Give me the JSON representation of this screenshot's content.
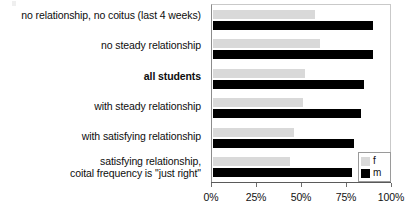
{
  "chart_data": {
    "type": "bar",
    "orientation": "horizontal",
    "title": "",
    "subtitle": "",
    "xlabel": "",
    "ylabel": "",
    "xlim": [
      0,
      100
    ],
    "grid": false,
    "legend_position": "bottom-right",
    "xticks": [
      "0%",
      "25%",
      "50%",
      "75%",
      "100%"
    ],
    "xtick_values": [
      0,
      25,
      50,
      75,
      100
    ],
    "categories": [
      "no relationship, no coitus (last 4 weeks)",
      "no steady relationship",
      "all students",
      "with steady relationship",
      "with satisfying relationship",
      "satisfying relationship, coital frequency is \"just right\""
    ],
    "category_lines": [
      [
        "no relationship, no coitus (last 4 weeks)"
      ],
      [
        "no steady relationship"
      ],
      [
        "all students"
      ],
      [
        "with steady relationship"
      ],
      [
        "with satisfying relationship"
      ],
      [
        "satisfying relationship,",
        "coital frequency is \"just right\""
      ]
    ],
    "emphasized_category_index": 2,
    "series": [
      {
        "name": "f",
        "color": "#d9d9d9",
        "values": [
          58,
          61,
          52,
          51,
          46,
          44
        ]
      },
      {
        "name": "m",
        "color": "#000000",
        "values": [
          91,
          91,
          86,
          84,
          80,
          79
        ]
      }
    ]
  },
  "legend": {
    "entries": [
      {
        "label": "f",
        "swatch": "light-gray"
      },
      {
        "label": "m",
        "swatch": "black"
      }
    ]
  }
}
